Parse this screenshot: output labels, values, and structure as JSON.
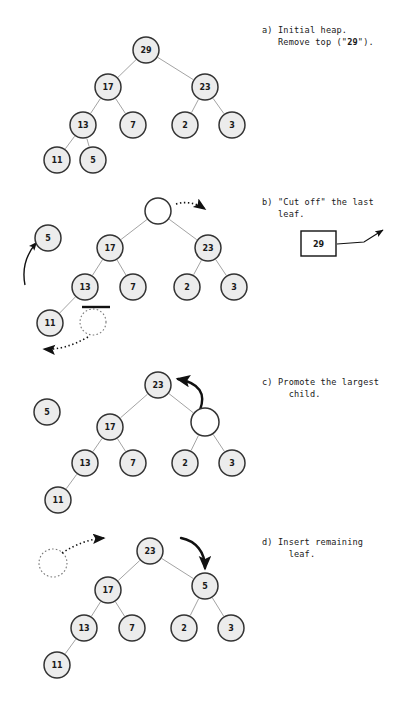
{
  "figure": {
    "width": 418,
    "height": 701,
    "background": "#ffffff",
    "node_fill": "#ececec",
    "node_stroke": "#333333",
    "edge_color": "#999999",
    "arrow_color": "#111111",
    "text_color": "#1a1a1a"
  },
  "captions": {
    "a": {
      "marker": "a)",
      "line1": "Initial heap.",
      "line2_pre": "Remove top (\"",
      "line2_bold": "29",
      "line2_post": "\")."
    },
    "b": {
      "marker": "b)",
      "line1": "\"Cut off\" the last",
      "line2": "leaf."
    },
    "c": {
      "marker": "c)",
      "line1": "Promote the largest",
      "line2": "child."
    },
    "d": {
      "marker": "d)",
      "line1": "Insert remaining",
      "line2": "leaf."
    }
  },
  "panel_a": {
    "label": "a",
    "nodes": [
      {
        "id": "root",
        "value": "29",
        "cx": 146,
        "cy": 50,
        "r": 13,
        "empty": false
      },
      {
        "id": "l1",
        "value": "17",
        "cx": 108,
        "cy": 87,
        "r": 13,
        "empty": false
      },
      {
        "id": "r1",
        "value": "23",
        "cx": 205,
        "cy": 87,
        "r": 13,
        "empty": false
      },
      {
        "id": "l2",
        "value": "13",
        "cx": 83,
        "cy": 125,
        "r": 13,
        "empty": false
      },
      {
        "id": "l3",
        "value": "7",
        "cx": 133,
        "cy": 125,
        "r": 13,
        "empty": false
      },
      {
        "id": "r2",
        "value": "2",
        "cx": 185,
        "cy": 125,
        "r": 13,
        "empty": false
      },
      {
        "id": "r3",
        "value": "3",
        "cx": 232,
        "cy": 125,
        "r": 13,
        "empty": false
      },
      {
        "id": "l4",
        "value": "11",
        "cx": 57,
        "cy": 160,
        "r": 13,
        "empty": false
      },
      {
        "id": "l5",
        "value": "5",
        "cx": 93,
        "cy": 160,
        "r": 13,
        "empty": false
      }
    ],
    "edges": [
      [
        "root",
        "l1"
      ],
      [
        "root",
        "r1"
      ],
      [
        "l1",
        "l2"
      ],
      [
        "l1",
        "l3"
      ],
      [
        "r1",
        "r2"
      ],
      [
        "r1",
        "r3"
      ],
      [
        "l2",
        "l4"
      ],
      [
        "l2",
        "l5"
      ]
    ]
  },
  "panel_b": {
    "label": "b",
    "removed_box": {
      "value": "29",
      "x": 301,
      "y": 231,
      "w": 35,
      "h": 25
    },
    "nodes": [
      {
        "id": "root",
        "value": "",
        "cx": 158,
        "cy": 211,
        "r": 13,
        "empty": true
      },
      {
        "id": "l1",
        "value": "17",
        "cx": 110,
        "cy": 248,
        "r": 13,
        "empty": false
      },
      {
        "id": "r1",
        "value": "23",
        "cx": 208,
        "cy": 248,
        "r": 13,
        "empty": false
      },
      {
        "id": "l2",
        "value": "13",
        "cx": 85,
        "cy": 287,
        "r": 13,
        "empty": false
      },
      {
        "id": "l3",
        "value": "7",
        "cx": 133,
        "cy": 287,
        "r": 13,
        "empty": false
      },
      {
        "id": "r2",
        "value": "2",
        "cx": 187,
        "cy": 287,
        "r": 13,
        "empty": false
      },
      {
        "id": "r3",
        "value": "3",
        "cx": 234,
        "cy": 287,
        "r": 13,
        "empty": false
      },
      {
        "id": "l4",
        "value": "11",
        "cx": 50,
        "cy": 323,
        "r": 13,
        "empty": false
      },
      {
        "id": "moved5",
        "value": "5",
        "cx": 48,
        "cy": 238,
        "r": 13,
        "empty": false
      }
    ],
    "ghost_node": {
      "cx": 93,
      "cy": 322,
      "r": 13
    },
    "edges": [
      [
        "root",
        "l1"
      ],
      [
        "root",
        "r1"
      ],
      [
        "l1",
        "l2"
      ],
      [
        "l1",
        "l3"
      ],
      [
        "r1",
        "r2"
      ],
      [
        "r1",
        "r3"
      ],
      [
        "l2",
        "l4"
      ]
    ],
    "strike_bar": {
      "x1": 82,
      "y1": 307,
      "x2": 110,
      "y2": 307
    }
  },
  "panel_c": {
    "label": "c",
    "nodes": [
      {
        "id": "root",
        "value": "23",
        "cx": 158,
        "cy": 385,
        "r": 13,
        "empty": false
      },
      {
        "id": "l1",
        "value": "17",
        "cx": 110,
        "cy": 427,
        "r": 13,
        "empty": false
      },
      {
        "id": "r1",
        "value": "",
        "cx": 205,
        "cy": 422,
        "r": 14,
        "empty": true
      },
      {
        "id": "l2",
        "value": "13",
        "cx": 85,
        "cy": 463,
        "r": 13,
        "empty": false
      },
      {
        "id": "l3",
        "value": "7",
        "cx": 133,
        "cy": 463,
        "r": 13,
        "empty": false
      },
      {
        "id": "r2",
        "value": "2",
        "cx": 185,
        "cy": 463,
        "r": 13,
        "empty": false
      },
      {
        "id": "r3",
        "value": "3",
        "cx": 232,
        "cy": 463,
        "r": 13,
        "empty": false
      },
      {
        "id": "l4",
        "value": "11",
        "cx": 58,
        "cy": 500,
        "r": 13,
        "empty": false
      },
      {
        "id": "loose5",
        "value": "5",
        "cx": 47,
        "cy": 412,
        "r": 13,
        "empty": false
      }
    ],
    "edges": [
      [
        "root",
        "l1"
      ],
      [
        "root",
        "r1"
      ],
      [
        "l1",
        "l2"
      ],
      [
        "l1",
        "l3"
      ],
      [
        "r1",
        "r2"
      ],
      [
        "r1",
        "r3"
      ],
      [
        "l2",
        "l4"
      ]
    ]
  },
  "panel_d": {
    "label": "d",
    "nodes": [
      {
        "id": "root",
        "value": "23",
        "cx": 150,
        "cy": 551,
        "r": 13,
        "empty": false
      },
      {
        "id": "l1",
        "value": "17",
        "cx": 108,
        "cy": 590,
        "r": 13,
        "empty": false
      },
      {
        "id": "r1",
        "value": "5",
        "cx": 205,
        "cy": 586,
        "r": 13,
        "empty": false
      },
      {
        "id": "l2",
        "value": "13",
        "cx": 84,
        "cy": 628,
        "r": 13,
        "empty": false
      },
      {
        "id": "l3",
        "value": "7",
        "cx": 132,
        "cy": 628,
        "r": 13,
        "empty": false
      },
      {
        "id": "r2",
        "value": "2",
        "cx": 184,
        "cy": 628,
        "r": 13,
        "empty": false
      },
      {
        "id": "r3",
        "value": "3",
        "cx": 231,
        "cy": 628,
        "r": 13,
        "empty": false
      },
      {
        "id": "l4",
        "value": "11",
        "cx": 57,
        "cy": 665,
        "r": 13,
        "empty": false
      }
    ],
    "ghost_node": {
      "cx": 53,
      "cy": 563,
      "r": 14
    },
    "edges": [
      [
        "root",
        "l1"
      ],
      [
        "root",
        "r1"
      ],
      [
        "l1",
        "l2"
      ],
      [
        "l1",
        "l3"
      ],
      [
        "r1",
        "r2"
      ],
      [
        "r1",
        "r3"
      ],
      [
        "l2",
        "l4"
      ]
    ]
  }
}
